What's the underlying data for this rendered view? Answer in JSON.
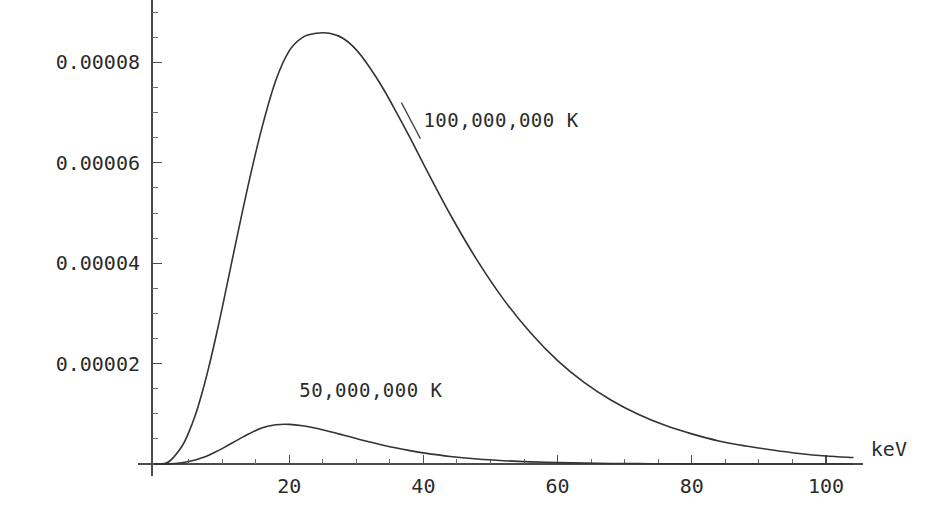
{
  "chart_data": {
    "type": "line",
    "title": "",
    "subtitle": "",
    "xlabel": "keV",
    "ylabel": "",
    "xlim": [
      0,
      104
    ],
    "ylim": [
      0,
      9.25e-05
    ],
    "grid": false,
    "legend_position": "inline-annotations",
    "x_ticks_major": [
      20,
      40,
      60,
      80,
      100
    ],
    "x_tick_labels": [
      "20",
      "40",
      "60",
      "80",
      "100"
    ],
    "x_ticks_minor": [
      5,
      10,
      15,
      25,
      30,
      35,
      45,
      50,
      55,
      65,
      70,
      75,
      85,
      90,
      95
    ],
    "y_ticks_major": [
      2e-05,
      4e-05,
      6e-05,
      8e-05
    ],
    "y_tick_labels": [
      "0.00002",
      "0.00004",
      "0.00006",
      "0.00008"
    ],
    "y_ticks_minor": [
      5e-06,
      1e-05,
      1.5e-05,
      2.5e-05,
      3e-05,
      3.5e-05,
      4.5e-05,
      5e-05,
      5.5e-05,
      6.5e-05,
      7e-05,
      7.5e-05,
      8.5e-05,
      9e-05
    ],
    "series": [
      {
        "name": "100,000,000 K",
        "label": "100,000,000 K",
        "color": "#333333",
        "peak_x": 26.2,
        "peak_y": 8.58e-05,
        "annotation_x": 40,
        "annotation_y": 6.72e-05,
        "x": [
          0,
          2,
          4,
          5,
          6,
          7,
          8,
          9,
          10,
          12,
          14,
          16,
          18,
          20,
          22,
          24,
          26,
          28,
          30,
          32,
          34,
          36,
          38,
          40,
          44,
          48,
          52,
          56,
          60,
          64,
          68,
          72,
          76,
          80,
          84,
          88,
          92,
          96,
          100,
          104
        ],
        "y": [
          0,
          4e-07,
          3.5e-06,
          6.2e-06,
          9.7e-06,
          1.41e-05,
          1.92e-05,
          2.49e-05,
          3.1e-05,
          4.38e-05,
          5.62e-05,
          6.73e-05,
          7.64e-05,
          8.23e-05,
          8.5e-05,
          8.58e-05,
          8.58e-05,
          8.48e-05,
          8.25e-05,
          7.9e-05,
          7.48e-05,
          7e-05,
          6.5e-05,
          5.98e-05,
          4.97e-05,
          4.06e-05,
          3.27e-05,
          2.61e-05,
          2.06e-05,
          1.62e-05,
          1.27e-05,
          9.9e-06,
          7.7e-06,
          6e-06,
          4.6e-06,
          3.6e-06,
          2.8e-06,
          2.1e-06,
          1.6e-06,
          1.3e-06
        ]
      },
      {
        "name": "50,000,000 K",
        "label": "50,000,000 K",
        "color": "#333333",
        "peak_x": 16.6,
        "peak_y": 7.9e-06,
        "annotation_x": 21.5,
        "annotation_y": 1.33e-05,
        "x": [
          0,
          2,
          4,
          5,
          6,
          7,
          8,
          9,
          10,
          12,
          14,
          16,
          18,
          20,
          22,
          24,
          26,
          28,
          30,
          32,
          34,
          36,
          38,
          40,
          44,
          48,
          52,
          56,
          60,
          64,
          68,
          72,
          76,
          80,
          84,
          88,
          92,
          96,
          100,
          104
        ],
        "y": [
          0,
          3e-08,
          2.5e-07,
          4.8e-07,
          8e-07,
          1.23e-06,
          1.76e-06,
          2.38e-06,
          3.07e-06,
          4.56e-06,
          6.01e-06,
          7.23e-06,
          7.82e-06,
          7.9e-06,
          7.62e-06,
          7.12e-06,
          6.48e-06,
          5.78e-06,
          5.07e-06,
          4.39e-06,
          3.75e-06,
          3.17e-06,
          2.66e-06,
          2.21e-06,
          1.5e-06,
          1e-06,
          6.6e-07,
          4.3e-07,
          2.8e-07,
          1.8e-07,
          1.1e-07,
          7e-08,
          5e-08,
          3e-08,
          2e-08,
          1e-08,
          1e-08,
          5e-09,
          3e-09,
          2e-09
        ]
      }
    ],
    "annotations": [
      {
        "text": "100,000,000 K",
        "x": 40,
        "y": 6.72e-05
      },
      {
        "text": "50,000,000 K",
        "x": 21.5,
        "y": 1.33e-05
      }
    ]
  },
  "plot_geometry": {
    "origin_x_px": 155,
    "origin_y_px": 464,
    "x_scale_px_per_unit": 6.71,
    "y_scale_px_per_unit": 5020000,
    "axis_color": "#4a4a4a",
    "curve_color": "#333333",
    "background_color": "#ffffff"
  }
}
